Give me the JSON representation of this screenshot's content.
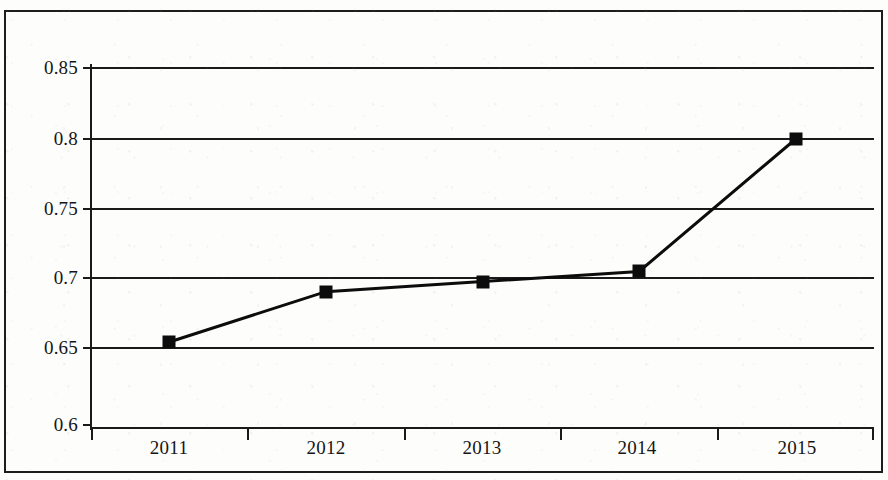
{
  "chart_data": {
    "type": "line",
    "title": "",
    "subtitle": "",
    "xlabel": "",
    "ylabel": "",
    "categories": [
      "2011",
      "2012",
      "2013",
      "2014",
      "2015"
    ],
    "series": [
      {
        "name": "",
        "values": [
          0.659,
          0.694,
          0.701,
          0.708,
          0.8
        ]
      }
    ],
    "ylim": [
      0.6,
      0.85
    ],
    "yticks": [
      0.6,
      0.65,
      0.7,
      0.75,
      0.8,
      0.85
    ],
    "ytick_labels": [
      "0.6",
      "0.65",
      "0.7",
      "0.75",
      "0.8",
      "0.85"
    ],
    "xtick_labels": [
      "2011",
      "2012",
      "2013",
      "2014",
      "2015"
    ],
    "grid": true,
    "grid_axis": "y",
    "legend": false,
    "legend_position": "none",
    "marker": "square",
    "marker_color": "#0c0c0c",
    "line_color": "#0c0c0c",
    "line_width": 3,
    "plot_background": "#ffffff",
    "axis_color": "#1a1a1a",
    "annotations": []
  },
  "figure": {
    "border_color": "#1d1d1d",
    "page_background": "#fdfdfc"
  }
}
